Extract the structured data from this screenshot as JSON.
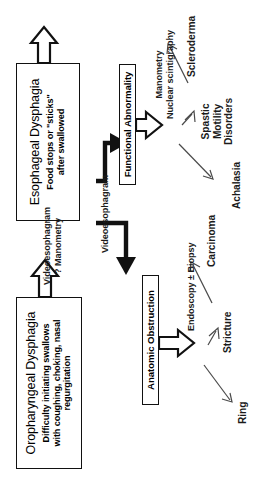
{
  "diagram": {
    "orientation": "rotated-90-ccw",
    "primary_nodes": [
      {
        "id": "oropharyngeal",
        "title": "Oropharyngeal Dysphagia",
        "sub_line1": "Difficulty initiating swallows",
        "sub_line2": "with coughing, choking, nasal",
        "sub_line3": "regurgitation"
      },
      {
        "id": "esophageal",
        "title": "Esophageal Dysphagia",
        "sub_line1": "Food stops or \"sticks\"",
        "sub_line2": "after swallowed"
      }
    ],
    "secondary_nodes": [
      {
        "id": "anatomic",
        "label": "Anatomic Obstruction"
      },
      {
        "id": "functional",
        "label": "Functional Abnormality"
      }
    ],
    "pathway_labels": [
      {
        "id": "videoeso-manometry",
        "line1": "Videoesophagram",
        "line2": "? Manometry"
      },
      {
        "id": "videoeso",
        "line1": "Videoesophagram",
        "line2": ""
      },
      {
        "id": "endoscopy",
        "line1": "Endoscopy ± Biopsy",
        "line2": ""
      },
      {
        "id": "manometry",
        "line1": "Manometry",
        "line2": "Nuclear scintigraphy"
      }
    ],
    "outcomes": [
      {
        "id": "ring",
        "line1": "Ring",
        "line2": "",
        "line3": ""
      },
      {
        "id": "stricture",
        "line1": "Stricture",
        "line2": "",
        "line3": ""
      },
      {
        "id": "carcinoma",
        "line1": "Carcinoma",
        "line2": "",
        "line3": ""
      },
      {
        "id": "achalasia",
        "line1": "Achalasia",
        "line2": "",
        "line3": ""
      },
      {
        "id": "spastic",
        "line1": "Spastic",
        "line2": "Motility",
        "line3": "Disorders"
      },
      {
        "id": "scleroderma",
        "line1": "Scleroderma",
        "line2": "",
        "line3": ""
      }
    ],
    "colors": {
      "background": "#ffffff",
      "stroke": "#111111",
      "text": "#1b1b1b",
      "thin_arrow": "#4a4a4a"
    }
  }
}
